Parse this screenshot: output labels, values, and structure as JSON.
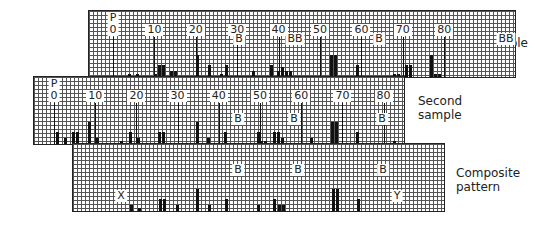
{
  "strips": [
    {
      "id": "sample",
      "label": "Sample",
      "box": {
        "x": 88,
        "y": 10,
        "w": 426,
        "h": 66
      },
      "zero_x": 112,
      "px_per_unit": 4.14,
      "ticks": [
        "0",
        "10",
        "20",
        "30",
        "40",
        "50",
        "60",
        "70",
        "80"
      ],
      "tick_prefix": "P",
      "markers": [
        {
          "text": "B",
          "x": 238,
          "y": 22
        },
        {
          "text": "BB",
          "x": 294,
          "y": 22
        },
        {
          "text": "B",
          "x": 378,
          "y": 22
        },
        {
          "text": "BB",
          "x": 505,
          "y": 22
        }
      ],
      "bars": [
        {
          "x": 128,
          "h": 3
        },
        {
          "x": 136,
          "h": 3
        },
        {
          "x": 154,
          "h": 3
        },
        {
          "x": 158,
          "h": 12
        },
        {
          "x": 162,
          "h": 12
        },
        {
          "x": 170,
          "h": 6
        },
        {
          "x": 174,
          "h": 6
        },
        {
          "x": 196,
          "h": 22
        },
        {
          "x": 208,
          "h": 12
        },
        {
          "x": 220,
          "h": 3
        },
        {
          "x": 225,
          "h": 12
        },
        {
          "x": 252,
          "h": 6
        },
        {
          "x": 270,
          "h": 12
        },
        {
          "x": 277,
          "h": 6
        },
        {
          "x": 281,
          "h": 10
        },
        {
          "x": 285,
          "h": 6
        },
        {
          "x": 289,
          "h": 6
        },
        {
          "x": 330,
          "h": 22
        },
        {
          "x": 334,
          "h": 22
        },
        {
          "x": 356,
          "h": 12
        },
        {
          "x": 393,
          "h": 3
        },
        {
          "x": 397,
          "h": 3
        },
        {
          "x": 405,
          "h": 12
        },
        {
          "x": 409,
          "h": 12
        },
        {
          "x": 430,
          "h": 22
        },
        {
          "x": 434,
          "h": 3
        },
        {
          "x": 438,
          "h": 3
        }
      ]
    },
    {
      "id": "second-sample",
      "label": "Second sample",
      "box": {
        "x": 33,
        "y": 76,
        "w": 370,
        "h": 67
      },
      "zero_x": 53,
      "px_per_unit": 4.12,
      "ticks": [
        "0",
        "10",
        "20",
        "30",
        "40",
        "50",
        "60",
        "70",
        "80"
      ],
      "tick_prefix": "P",
      "markers": [
        {
          "text": "B",
          "x": 237,
          "y": 36
        },
        {
          "text": "B",
          "x": 293,
          "y": 36
        },
        {
          "text": "B",
          "x": 381,
          "y": 36
        }
      ],
      "bars": [
        {
          "x": 56,
          "h": 12
        },
        {
          "x": 64,
          "h": 6
        },
        {
          "x": 72,
          "h": 12
        },
        {
          "x": 76,
          "h": 12
        },
        {
          "x": 88,
          "h": 22
        },
        {
          "x": 96,
          "h": 6
        },
        {
          "x": 120,
          "h": 3
        },
        {
          "x": 129,
          "h": 12
        },
        {
          "x": 137,
          "h": 6
        },
        {
          "x": 158,
          "h": 12
        },
        {
          "x": 162,
          "h": 12
        },
        {
          "x": 196,
          "h": 22
        },
        {
          "x": 207,
          "h": 6
        },
        {
          "x": 224,
          "h": 12
        },
        {
          "x": 257,
          "h": 12
        },
        {
          "x": 260,
          "h": 3
        },
        {
          "x": 264,
          "h": 3
        },
        {
          "x": 273,
          "h": 12
        },
        {
          "x": 277,
          "h": 12
        },
        {
          "x": 281,
          "h": 6
        },
        {
          "x": 310,
          "h": 6
        },
        {
          "x": 331,
          "h": 22
        },
        {
          "x": 335,
          "h": 22
        },
        {
          "x": 356,
          "h": 12
        },
        {
          "x": 393,
          "h": 3
        }
      ]
    },
    {
      "id": "composite",
      "label": "Composite pattern",
      "box": {
        "x": 72,
        "y": 143,
        "w": 371,
        "h": 67
      },
      "markers": [
        {
          "text": "B",
          "x": 237,
          "y": 20
        },
        {
          "text": "B",
          "x": 297,
          "y": 20
        },
        {
          "text": "B",
          "x": 382,
          "y": 20
        },
        {
          "text": "X",
          "x": 120,
          "y": 46
        },
        {
          "text": "Y",
          "x": 396,
          "y": 46
        }
      ],
      "bars": [
        {
          "x": 130,
          "h": 6
        },
        {
          "x": 138,
          "h": 3
        },
        {
          "x": 159,
          "h": 12
        },
        {
          "x": 163,
          "h": 12
        },
        {
          "x": 176,
          "h": 6
        },
        {
          "x": 196,
          "h": 22
        },
        {
          "x": 208,
          "h": 6
        },
        {
          "x": 225,
          "h": 12
        },
        {
          "x": 257,
          "h": 6
        },
        {
          "x": 273,
          "h": 12
        },
        {
          "x": 278,
          "h": 6
        },
        {
          "x": 282,
          "h": 6
        },
        {
          "x": 332,
          "h": 22
        },
        {
          "x": 336,
          "h": 22
        },
        {
          "x": 357,
          "h": 12
        }
      ]
    }
  ],
  "side_labels": {
    "sample": [
      "Sample"
    ],
    "second": [
      "Second",
      "sample"
    ],
    "composite": [
      "Composite",
      "pattern"
    ]
  }
}
